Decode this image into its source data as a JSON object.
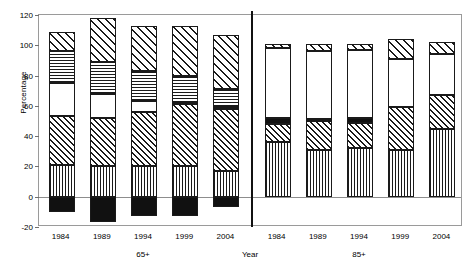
{
  "chart_data": {
    "type": "bar",
    "title": "",
    "subtitle": "",
    "xlabel": "Year",
    "ylabel": "Percentage",
    "ylim": [
      -20,
      120
    ],
    "yticks": [
      -20,
      0,
      20,
      40,
      60,
      80,
      100,
      120
    ],
    "ytick_labels": [
      "-20",
      "0",
      "20",
      "40",
      "60",
      "80",
      "100",
      "120"
    ],
    "grid": false,
    "legend": "none",
    "stacked": true,
    "categories": [
      "1984",
      "1989",
      "1994",
      "1999",
      "2004"
    ],
    "panels": [
      {
        "name": "65+",
        "label": "65+",
        "categories": [
          "1984",
          "1989",
          "1994",
          "1999",
          "2004"
        ],
        "bars": [
          {
            "category": "1984",
            "total_positive": 109,
            "total_negative": -10,
            "segments": [
              {
                "series": "black-solid",
                "pattern": "solid-black",
                "from": 0,
                "to": -10,
                "value": -10
              },
              {
                "series": "vertical-lines",
                "pattern": "vertical-lines",
                "from": 0,
                "to": 21,
                "value": 21
              },
              {
                "series": "diagonal-hatch",
                "pattern": "diagonal-hatch",
                "from": 21,
                "to": 53,
                "value": 32
              },
              {
                "series": "white",
                "pattern": "white",
                "from": 53,
                "to": 75,
                "value": 22
              },
              {
                "series": "horizontal-lines",
                "pattern": "horizontal-lines",
                "from": 75,
                "to": 96,
                "value": 21
              },
              {
                "series": "diagonal-hatch-wide",
                "pattern": "diagonal-hatch-wide",
                "from": 96,
                "to": 109,
                "value": 13
              }
            ]
          },
          {
            "category": "1989",
            "total_positive": 118,
            "total_negative": -17,
            "segments": [
              {
                "series": "black-solid",
                "pattern": "solid-black",
                "from": 0,
                "to": -17,
                "value": -17
              },
              {
                "series": "vertical-lines",
                "pattern": "vertical-lines",
                "from": 0,
                "to": 20,
                "value": 20
              },
              {
                "series": "diagonal-hatch",
                "pattern": "diagonal-hatch",
                "from": 20,
                "to": 52,
                "value": 32
              },
              {
                "series": "white",
                "pattern": "white",
                "from": 52,
                "to": 68,
                "value": 16
              },
              {
                "series": "horizontal-lines",
                "pattern": "horizontal-lines",
                "from": 68,
                "to": 89,
                "value": 21
              },
              {
                "series": "diagonal-hatch-wide",
                "pattern": "diagonal-hatch-wide",
                "from": 89,
                "to": 118,
                "value": 29
              }
            ]
          },
          {
            "category": "1994",
            "total_positive": 113,
            "total_negative": -13,
            "segments": [
              {
                "series": "black-solid",
                "pattern": "solid-black",
                "from": 0,
                "to": -13,
                "value": -13
              },
              {
                "series": "vertical-lines",
                "pattern": "vertical-lines",
                "from": 0,
                "to": 20,
                "value": 20
              },
              {
                "series": "diagonal-hatch",
                "pattern": "diagonal-hatch",
                "from": 20,
                "to": 56,
                "value": 36
              },
              {
                "series": "white",
                "pattern": "white",
                "from": 56,
                "to": 63,
                "value": 7
              },
              {
                "series": "horizontal-lines",
                "pattern": "horizontal-lines",
                "from": 63,
                "to": 83,
                "value": 20
              },
              {
                "series": "diagonal-hatch-wide",
                "pattern": "diagonal-hatch-wide",
                "from": 83,
                "to": 113,
                "value": 30
              }
            ]
          },
          {
            "category": "1999",
            "total_positive": 113,
            "total_negative": -13,
            "segments": [
              {
                "series": "black-solid",
                "pattern": "solid-black",
                "from": 0,
                "to": -13,
                "value": -13
              },
              {
                "series": "vertical-lines",
                "pattern": "vertical-lines",
                "from": 0,
                "to": 20,
                "value": 20
              },
              {
                "series": "diagonal-hatch",
                "pattern": "diagonal-hatch",
                "from": 20,
                "to": 61,
                "value": 41
              },
              {
                "series": "white",
                "pattern": "white",
                "from": 61,
                "to": 62,
                "value": 1
              },
              {
                "series": "horizontal-lines",
                "pattern": "horizontal-lines",
                "from": 62,
                "to": 80,
                "value": 18
              },
              {
                "series": "diagonal-hatch-wide",
                "pattern": "diagonal-hatch-wide",
                "from": 80,
                "to": 113,
                "value": 33
              }
            ]
          },
          {
            "category": "2004",
            "total_positive": 107,
            "total_negative": -7,
            "segments": [
              {
                "series": "black-solid",
                "pattern": "solid-black",
                "from": 0,
                "to": -7,
                "value": -7
              },
              {
                "series": "vertical-lines",
                "pattern": "vertical-lines",
                "from": 0,
                "to": 17,
                "value": 17
              },
              {
                "series": "diagonal-hatch",
                "pattern": "diagonal-hatch",
                "from": 17,
                "to": 58,
                "value": 41
              },
              {
                "series": "white",
                "pattern": "white",
                "from": 58,
                "to": 59,
                "value": 1
              },
              {
                "series": "horizontal-lines",
                "pattern": "horizontal-lines",
                "from": 59,
                "to": 71,
                "value": 12
              },
              {
                "series": "diagonal-hatch-wide",
                "pattern": "diagonal-hatch-wide",
                "from": 71,
                "to": 107,
                "value": 36
              }
            ]
          }
        ]
      },
      {
        "name": "85+",
        "label": "85+",
        "categories": [
          "1984",
          "1989",
          "1994",
          "1999",
          "2004"
        ],
        "bars": [
          {
            "category": "1984",
            "total_positive": 101,
            "total_negative": 0,
            "segments": [
              {
                "series": "vertical-lines",
                "pattern": "vertical-lines",
                "from": 0,
                "to": 36,
                "value": 36
              },
              {
                "series": "diagonal-hatch",
                "pattern": "diagonal-hatch",
                "from": 36,
                "to": 48,
                "value": 12
              },
              {
                "series": "black-solid",
                "pattern": "solid-black",
                "from": 48,
                "to": 52,
                "value": 4
              },
              {
                "series": "white",
                "pattern": "white",
                "from": 52,
                "to": 98,
                "value": 46
              },
              {
                "series": "diagonal-hatch-wide",
                "pattern": "diagonal-hatch-wide",
                "from": 98,
                "to": 101,
                "value": 3
              }
            ]
          },
          {
            "category": "1989",
            "total_positive": 101,
            "total_negative": 0,
            "segments": [
              {
                "series": "vertical-lines",
                "pattern": "vertical-lines",
                "from": 0,
                "to": 31,
                "value": 31
              },
              {
                "series": "diagonal-hatch",
                "pattern": "diagonal-hatch",
                "from": 31,
                "to": 50,
                "value": 19
              },
              {
                "series": "black-solid",
                "pattern": "solid-black",
                "from": 50,
                "to": 51,
                "value": 1
              },
              {
                "series": "white",
                "pattern": "white",
                "from": 51,
                "to": 96,
                "value": 45
              },
              {
                "series": "diagonal-hatch-wide",
                "pattern": "diagonal-hatch-wide",
                "from": 96,
                "to": 101,
                "value": 5
              }
            ]
          },
          {
            "category": "1994",
            "total_positive": 101,
            "total_negative": 0,
            "segments": [
              {
                "series": "vertical-lines",
                "pattern": "vertical-lines",
                "from": 0,
                "to": 32,
                "value": 32
              },
              {
                "series": "diagonal-hatch",
                "pattern": "diagonal-hatch",
                "from": 32,
                "to": 49,
                "value": 17
              },
              {
                "series": "black-solid",
                "pattern": "solid-black",
                "from": 49,
                "to": 52,
                "value": 3
              },
              {
                "series": "white",
                "pattern": "white",
                "from": 52,
                "to": 97,
                "value": 45
              },
              {
                "series": "diagonal-hatch-wide",
                "pattern": "diagonal-hatch-wide",
                "from": 97,
                "to": 101,
                "value": 4
              }
            ]
          },
          {
            "category": "1999",
            "total_positive": 104,
            "total_negative": 0,
            "segments": [
              {
                "series": "vertical-lines",
                "pattern": "vertical-lines",
                "from": 0,
                "to": 31,
                "value": 31
              },
              {
                "series": "diagonal-hatch",
                "pattern": "diagonal-hatch",
                "from": 31,
                "to": 59,
                "value": 28
              },
              {
                "series": "white",
                "pattern": "white",
                "from": 59,
                "to": 91,
                "value": 32
              },
              {
                "series": "diagonal-hatch-wide",
                "pattern": "diagonal-hatch-wide",
                "from": 91,
                "to": 104,
                "value": 13
              }
            ]
          },
          {
            "category": "2004",
            "total_positive": 102,
            "total_negative": 0,
            "segments": [
              {
                "series": "vertical-lines",
                "pattern": "vertical-lines",
                "from": 0,
                "to": 45,
                "value": 45
              },
              {
                "series": "diagonal-hatch",
                "pattern": "diagonal-hatch",
                "from": 45,
                "to": 67,
                "value": 22
              },
              {
                "series": "white",
                "pattern": "white",
                "from": 67,
                "to": 94,
                "value": 27
              },
              {
                "series": "diagonal-hatch-wide",
                "pattern": "diagonal-hatch-wide",
                "from": 94,
                "to": 102,
                "value": 8
              }
            ]
          }
        ]
      }
    ]
  },
  "colors": {
    "ink": "#111111",
    "axis": "#9a9a9a",
    "background": "#ffffff"
  }
}
